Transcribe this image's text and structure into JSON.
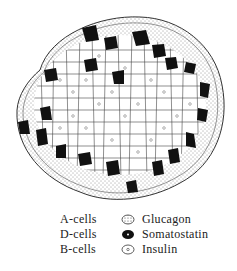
{
  "diagram": {
    "regions": {
      "mantle": "A-cells (glucagon), stippled, peripheral ring",
      "core": "B-cells (insulin), clear cells with small nucleus",
      "scattered": "D-cells (somatostatin), black cells at border between mantle and core"
    }
  },
  "legend": [
    {
      "cell": "A-cells",
      "symbol": "stippled-cell-icon",
      "hormone": "Glucagon"
    },
    {
      "cell": "D-cells",
      "symbol": "black-cell-icon",
      "hormone": "Somatostatin"
    },
    {
      "cell": "B-cells",
      "symbol": "clear-cell-icon",
      "hormone": "Insulin"
    }
  ],
  "colors": {
    "ink": "#222222",
    "d_cell": "#111111",
    "background": "#ffffff"
  }
}
